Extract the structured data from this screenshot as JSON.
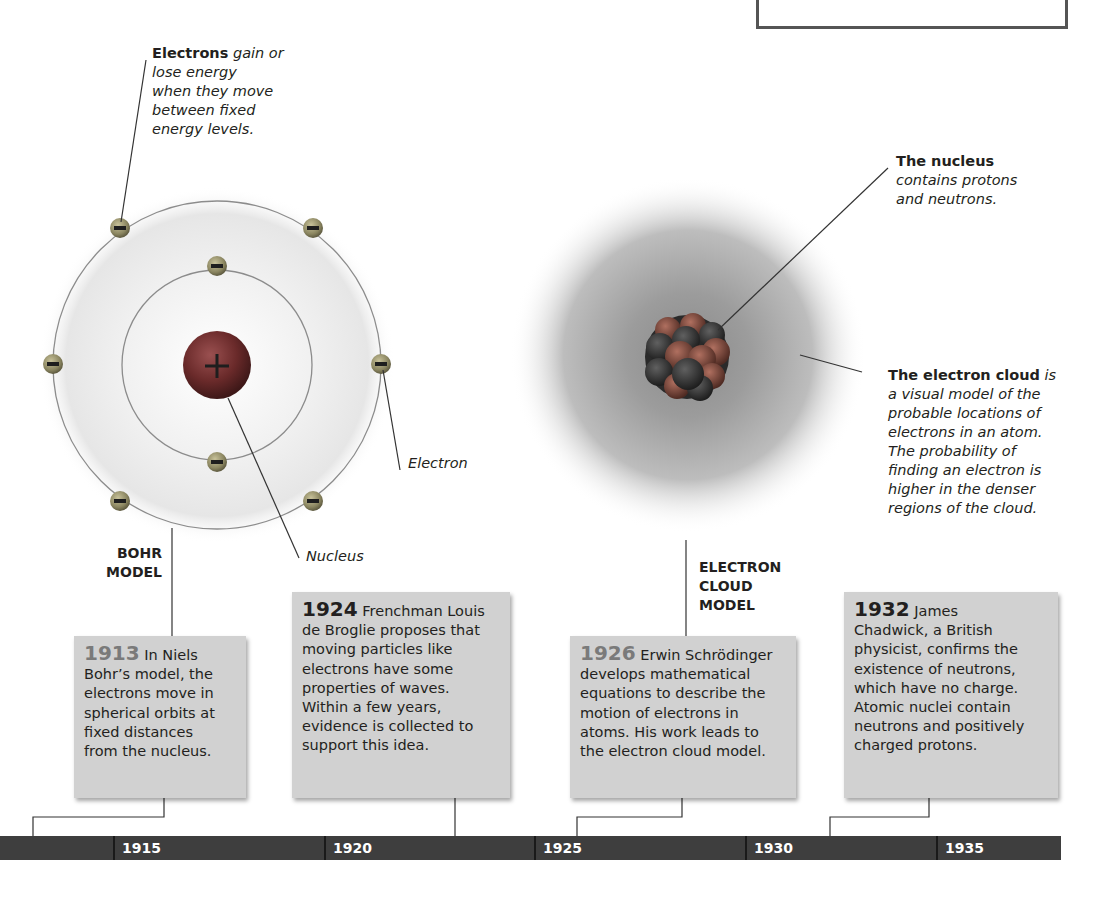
{
  "callouts": {
    "electrons_bold": "Electrons",
    "electrons_text": "gain or lose energy when they move between fixed energy levels.",
    "electrons_lines": [
      "gain or",
      "lose energy",
      "when they move",
      "between fixed",
      "energy levels."
    ],
    "electron_label": "Electron",
    "nucleus_label": "Nucleus",
    "nucleus_bold": "The nucleus",
    "nucleus_lines": [
      "contains protons",
      "and neutrons."
    ],
    "cloud_bold": "The electron cloud",
    "cloud_first": "is",
    "cloud_lines": [
      "a visual model of the",
      "probable locations of",
      "electrons in an atom.",
      "The probability of",
      "finding an electron is",
      "higher in the denser",
      "regions of the cloud."
    ]
  },
  "models": {
    "bohr": [
      "BOHR",
      "MODEL"
    ],
    "cloud": [
      "ELECTRON",
      "CLOUD",
      "MODEL"
    ]
  },
  "cards": [
    {
      "year": "1913",
      "lines": [
        "In Niels",
        "Bohr’s model, the",
        "electrons move in",
        "spherical orbits at",
        "fixed distances",
        "from the nucleus."
      ]
    },
    {
      "year": "1924",
      "lines": [
        "Frenchman Louis",
        "de Broglie proposes that",
        "moving particles like",
        "electrons have some",
        "properties of waves.",
        "Within a few years,",
        "evidence is collected to",
        "support this idea."
      ]
    },
    {
      "year": "1926",
      "lines": [
        "Erwin Schrödinger",
        "develops mathematical",
        "equations to describe the",
        "motion of electrons in",
        "atoms. His work leads to",
        "the electron cloud model."
      ]
    },
    {
      "year": "1932",
      "lines": [
        "James",
        "Chadwick, a British",
        "physicist, confirms the",
        "existence of neutrons,",
        "which have no charge.",
        "Atomic nuclei contain",
        "neutrons and positively",
        "charged protons."
      ]
    }
  ],
  "timeline": {
    "ticks": [
      "1915",
      "1920",
      "1925",
      "1930",
      "1935"
    ]
  },
  "colors": {
    "axis": "#3e3e3e",
    "card": "#d1d1d1",
    "nucleus": "#7a3030",
    "electron": "#8a8a6a"
  }
}
